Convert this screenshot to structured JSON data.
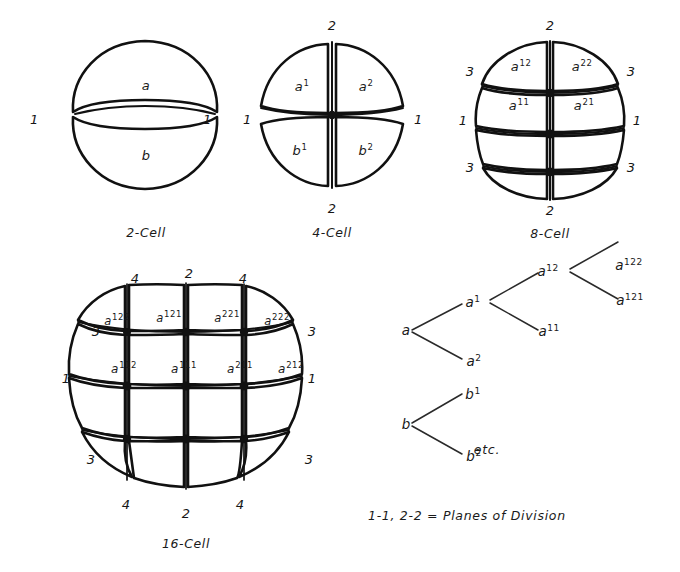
{
  "figure": {
    "title_present": false,
    "background_color": "#ffffff",
    "ink_color": "#111111",
    "legend": "1-1, 2-2 = Planes of Division",
    "etc_marker": "etc."
  },
  "stages": [
    {
      "id": "two-cell",
      "caption": "2-Cell",
      "cells": [
        {
          "base": "a",
          "sup": ""
        },
        {
          "base": "b",
          "sup": ""
        }
      ],
      "plane_labels": [
        {
          "value": "1",
          "side": "left"
        },
        {
          "value": "1",
          "side": "right"
        }
      ]
    },
    {
      "id": "four-cell",
      "caption": "4-Cell",
      "cells": [
        {
          "base": "a",
          "sup": "1"
        },
        {
          "base": "a",
          "sup": "2"
        },
        {
          "base": "b",
          "sup": "1"
        },
        {
          "base": "b",
          "sup": "2"
        }
      ],
      "plane_labels": [
        {
          "value": "2",
          "side": "top"
        },
        {
          "value": "1",
          "side": "left"
        },
        {
          "value": "1",
          "side": "right"
        },
        {
          "value": "2",
          "side": "bottom"
        }
      ]
    },
    {
      "id": "eight-cell",
      "caption": "8-Cell",
      "cells": [
        {
          "base": "a",
          "sup": "12"
        },
        {
          "base": "a",
          "sup": "22"
        },
        {
          "base": "a",
          "sup": "11"
        },
        {
          "base": "a",
          "sup": "21"
        }
      ],
      "plane_labels": [
        {
          "value": "2",
          "side": "top"
        },
        {
          "value": "3",
          "side": "left-upper"
        },
        {
          "value": "3",
          "side": "right-upper"
        },
        {
          "value": "1",
          "side": "left"
        },
        {
          "value": "1",
          "side": "right"
        },
        {
          "value": "3",
          "side": "left-lower"
        },
        {
          "value": "3",
          "side": "right-lower"
        },
        {
          "value": "2",
          "side": "bottom"
        }
      ]
    },
    {
      "id": "sixteen-cell",
      "caption": "16-Cell",
      "cells": [
        {
          "base": "a",
          "sup": "122"
        },
        {
          "base": "a",
          "sup": "121"
        },
        {
          "base": "a",
          "sup": "221"
        },
        {
          "base": "a",
          "sup": "222"
        },
        {
          "base": "a",
          "sup": "112"
        },
        {
          "base": "a",
          "sup": "111"
        },
        {
          "base": "a",
          "sup": "211"
        },
        {
          "base": "a",
          "sup": "212"
        }
      ],
      "plane_labels": [
        {
          "value": "4",
          "side": "top-left"
        },
        {
          "value": "2",
          "side": "top"
        },
        {
          "value": "4",
          "side": "top-right"
        },
        {
          "value": "3",
          "side": "left-upper"
        },
        {
          "value": "3",
          "side": "right-upper"
        },
        {
          "value": "1",
          "side": "left"
        },
        {
          "value": "1",
          "side": "right"
        },
        {
          "value": "3",
          "side": "left-lower"
        },
        {
          "value": "3",
          "side": "right-lower"
        },
        {
          "value": "4",
          "side": "bottom-left"
        },
        {
          "value": "2",
          "side": "bottom"
        },
        {
          "value": "4",
          "side": "bottom-right"
        }
      ]
    }
  ],
  "lineage_tree": {
    "nodes": [
      {
        "key": "a",
        "base": "a",
        "sup": ""
      },
      {
        "key": "a1",
        "base": "a",
        "sup": "1"
      },
      {
        "key": "a2",
        "base": "a",
        "sup": "2"
      },
      {
        "key": "a12",
        "base": "a",
        "sup": "12"
      },
      {
        "key": "a11",
        "base": "a",
        "sup": "11"
      },
      {
        "key": "a122",
        "base": "a",
        "sup": "122"
      },
      {
        "key": "a121",
        "base": "a",
        "sup": "121"
      },
      {
        "key": "b",
        "base": "b",
        "sup": ""
      },
      {
        "key": "b1",
        "base": "b",
        "sup": "1"
      },
      {
        "key": "b2",
        "base": "b",
        "sup": "2"
      }
    ],
    "edges": [
      {
        "from": "a",
        "to": "a1"
      },
      {
        "from": "a",
        "to": "a2"
      },
      {
        "from": "a1",
        "to": "a12"
      },
      {
        "from": "a1",
        "to": "a11"
      },
      {
        "from": "a12",
        "to": "a122"
      },
      {
        "from": "a12",
        "to": "a121"
      },
      {
        "from": "b",
        "to": "b1"
      },
      {
        "from": "b",
        "to": "b2"
      }
    ]
  }
}
